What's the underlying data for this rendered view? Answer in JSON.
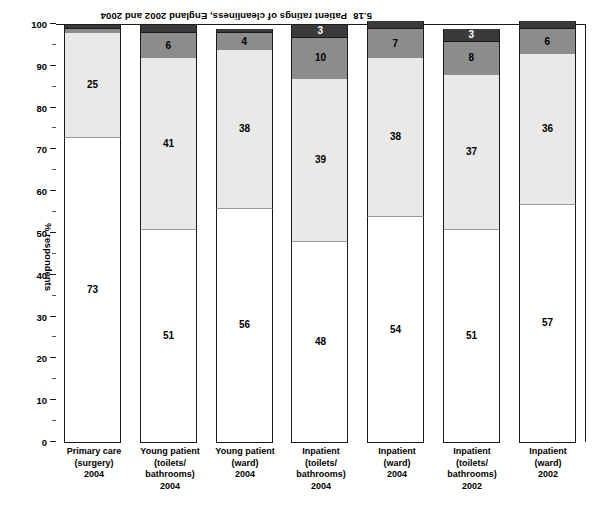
{
  "figure": {
    "number": "5.18",
    "caption": "Patient ratings of cleanliness, England 2002 and 2004"
  },
  "axis": {
    "y_title": "% respondents",
    "y_ticks": [
      "0",
      "10",
      "20",
      "30",
      "40",
      "50",
      "60",
      "70",
      "80",
      "90",
      "100"
    ]
  },
  "chart_data": {
    "type": "bar",
    "xlabel": "",
    "ylabel": "% respondents",
    "ylim": [
      0,
      100
    ],
    "grid": false,
    "stacked": true,
    "orientation": "vertical",
    "legend_position": "none",
    "categories": [
      "Inpatient (ward) 2002",
      "Inpatient (toilets/bathrooms) 2002",
      "Inpatient (ward) 2004",
      "Inpatient (toilets/bathrooms) 2004",
      "Young patient (ward) 2004",
      "Young patient (toilets/bathrooms) 2004",
      "Primary care (surgery) 2004"
    ],
    "category_lines": [
      [
        "Inpatient",
        "(ward)",
        "2002"
      ],
      [
        "Inpatient",
        "(toilets/",
        "bathrooms)",
        "2002"
      ],
      [
        "Inpatient",
        "(ward)",
        "2004"
      ],
      [
        "Inpatient",
        "(toilets/",
        "bathrooms)",
        "2004"
      ],
      [
        "Young patient",
        "(ward)",
        "2004"
      ],
      [
        "Young patient",
        "(toilets/",
        "bathrooms)",
        "2004"
      ],
      [
        "Primary care",
        "(surgery)",
        "2004"
      ]
    ],
    "series": [
      {
        "name": "Very clean",
        "color": "#ffffff",
        "values": [
          57,
          51,
          54,
          48,
          56,
          51,
          73
        ]
      },
      {
        "name": "Fairly clean",
        "color": "#e9e9e7",
        "values": [
          36,
          37,
          38,
          39,
          38,
          41,
          25
        ]
      },
      {
        "name": "Not very clean",
        "color": "#8c8c8c",
        "values": [
          6,
          8,
          7,
          10,
          4,
          6,
          1
        ]
      },
      {
        "name": "Not at all clean",
        "color": "#3a3a3a",
        "values": [
          2,
          3,
          2,
          3,
          1,
          2,
          1
        ]
      }
    ]
  },
  "bars": [
    {
      "id": "inpatient-ward-2002",
      "segments": [
        {
          "v": "57"
        },
        {
          "v": "36"
        },
        {
          "v": "6"
        },
        {
          "v": "2"
        }
      ]
    },
    {
      "id": "inpatient-toilets-2002",
      "segments": [
        {
          "v": "51"
        },
        {
          "v": "37"
        },
        {
          "v": "8"
        },
        {
          "v": "3"
        }
      ]
    },
    {
      "id": "inpatient-ward-2004",
      "segments": [
        {
          "v": "54"
        },
        {
          "v": "38"
        },
        {
          "v": "7"
        },
        {
          "v": "2"
        }
      ]
    },
    {
      "id": "inpatient-toilets-2004",
      "segments": [
        {
          "v": "48"
        },
        {
          "v": "39"
        },
        {
          "v": "10"
        },
        {
          "v": "3"
        }
      ]
    },
    {
      "id": "young-patient-ward-2004",
      "segments": [
        {
          "v": "56"
        },
        {
          "v": "38"
        },
        {
          "v": "4"
        },
        {
          "v": "1"
        }
      ]
    },
    {
      "id": "young-patient-toilets-2004",
      "segments": [
        {
          "v": "51"
        },
        {
          "v": "41"
        },
        {
          "v": "6"
        },
        {
          "v": "2"
        }
      ]
    },
    {
      "id": "primary-care-surgery-2004",
      "segments": [
        {
          "v": "73"
        },
        {
          "v": "25"
        },
        {
          "v": "1"
        },
        {
          "v": "1"
        }
      ]
    }
  ]
}
